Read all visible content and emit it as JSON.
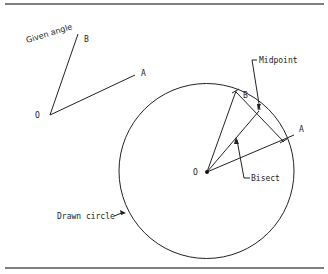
{
  "figure": {
    "title_label": "Given angle",
    "given_angle": {
      "vertex_label": "O",
      "ray_b_label": "B",
      "ray_a_label": "A"
    },
    "construction": {
      "vertex_label": "O",
      "point_b_label": "B",
      "point_a_label": "A",
      "midpoint_label": "Midpoint",
      "bisect_label": "Bisect",
      "circle_label": "Drawn circle"
    }
  },
  "colors": {
    "line": "#222222",
    "rule": "#555555",
    "background": "#ffffff"
  }
}
